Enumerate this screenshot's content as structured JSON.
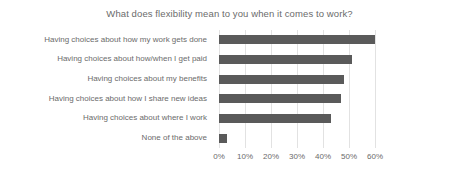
{
  "chart_data": {
    "type": "bar",
    "orientation": "horizontal",
    "title": "What does flexibility mean to you when it comes to work?",
    "xlabel": "",
    "ylabel": "",
    "xlim": [
      0,
      60
    ],
    "xtick_step": 10,
    "grid": true,
    "legend": "none",
    "bar_color": "#5a5a5a",
    "grid_color": "#e2e2e2",
    "text_color": "#6b6b6b",
    "tick_format": "percent",
    "categories": [
      "Having choices about how my work gets done",
      "Having choices about how/when I get paid",
      "Having choices about my benefits",
      "Having choices about how I share new ideas",
      "Having choices about where I work",
      "None of the above"
    ],
    "values": [
      60,
      51,
      48,
      47,
      43,
      3
    ],
    "xticks": [
      0,
      10,
      20,
      30,
      40,
      50,
      60
    ],
    "xticklabels": [
      "0%",
      "10%",
      "20%",
      "30%",
      "40%",
      "50%",
      "60%"
    ]
  }
}
